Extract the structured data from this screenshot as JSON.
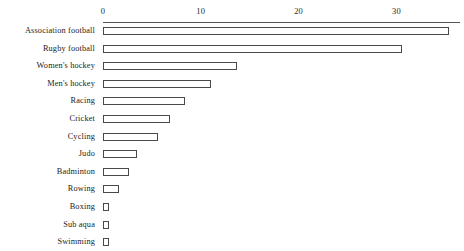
{
  "chart_data": {
    "type": "bar",
    "orientation": "horizontal",
    "title": "",
    "subtitle": "",
    "xlabel": "",
    "ylabel": "",
    "xlim": [
      0,
      36.5
    ],
    "xticks": [
      0,
      10,
      20,
      30
    ],
    "xtick_labels": [
      "0",
      "10",
      "20",
      "30"
    ],
    "grid": false,
    "legend": null,
    "axis_position": "top",
    "bar_style": {
      "fill": "#ffffff",
      "border": "#4a4a4a"
    },
    "categories": [
      "Association football",
      "Rugby football",
      "Women's hockey",
      "Men's hockey",
      "Racing",
      "Cricket",
      "Cycling",
      "Judo",
      "Badminton",
      "Rowing",
      "Boxing",
      "Sub aqua",
      "Swimming"
    ],
    "values": [
      35.4,
      30.6,
      13.7,
      11.0,
      8.4,
      6.8,
      5.6,
      3.5,
      2.7,
      1.6,
      0.6,
      0.5,
      0.5
    ]
  }
}
